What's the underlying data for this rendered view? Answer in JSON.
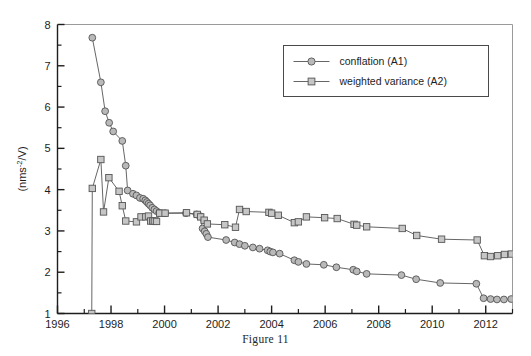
{
  "figure": {
    "caption": "Figure 11"
  },
  "chart_data": {
    "type": "line",
    "title": "",
    "xlabel": "",
    "ylabel": "(nms-2/V)",
    "ylabel_parts": {
      "pre": "(nms",
      "sup": "-2",
      "post": "/V)"
    },
    "xlim": [
      1996,
      2013
    ],
    "ylim": [
      1,
      8
    ],
    "xticks": [
      1996,
      1998,
      2000,
      2002,
      2004,
      2006,
      2008,
      2010,
      2012
    ],
    "xtick_labels": [
      "1996",
      "1998",
      "2000",
      "2002",
      "2004",
      "2006",
      "2008",
      "2010",
      "2012"
    ],
    "xminor_ticks": [
      1997,
      1999,
      2001,
      2003,
      2005,
      2007,
      2009,
      2011,
      2013
    ],
    "yticks": [
      1,
      2,
      3,
      4,
      5,
      6,
      7,
      8
    ],
    "ytick_labels": [
      "1",
      "2",
      "3",
      "4",
      "5",
      "6",
      "7",
      "8"
    ],
    "yminor_ticks": [
      1.5,
      2.5,
      3.5,
      4.5,
      5.5,
      6.5,
      7.5
    ],
    "grid": false,
    "legend_position": "upper-right",
    "series": [
      {
        "name": "conflation (A1)",
        "marker": "circle",
        "color": "#555555",
        "marker_fill": "#b9b9b9",
        "x": [
          1997.3,
          1997.62,
          1997.78,
          1997.93,
          1998.08,
          1998.42,
          1998.55,
          1998.62,
          1998.82,
          1998.95,
          1999.08,
          1999.2,
          1999.28,
          1999.34,
          1999.4,
          1999.46,
          1999.54,
          1999.62,
          1999.7,
          1999.8,
          2000.02,
          2000.8,
          2001.2,
          2001.32,
          2001.42,
          2001.5,
          2001.56,
          2001.62,
          2002.3,
          2002.62,
          2002.8,
          2003.0,
          2003.3,
          2003.55,
          2003.85,
          2003.95,
          2004.05,
          2004.3,
          2004.85,
          2005.0,
          2005.3,
          2005.95,
          2006.42,
          2007.05,
          2007.18,
          2007.55,
          2008.85,
          2009.4,
          2010.3,
          2011.65,
          2011.92,
          2012.18,
          2012.42,
          2012.68,
          2012.95
        ],
        "y": [
          7.68,
          6.6,
          5.9,
          5.62,
          5.41,
          5.18,
          4.58,
          3.98,
          3.9,
          3.86,
          3.8,
          3.78,
          3.74,
          3.7,
          3.66,
          3.62,
          3.56,
          3.52,
          3.48,
          3.44,
          3.43,
          3.43,
          3.4,
          3.36,
          3.06,
          2.99,
          2.93,
          2.85,
          2.78,
          2.72,
          2.68,
          2.64,
          2.6,
          2.57,
          2.53,
          2.5,
          2.48,
          2.45,
          2.29,
          2.25,
          2.2,
          2.18,
          2.12,
          2.06,
          2.02,
          1.96,
          1.93,
          1.83,
          1.74,
          1.72,
          1.37,
          1.35,
          1.34,
          1.34,
          1.35
        ]
      },
      {
        "name": "weighted variance (A2)",
        "marker": "square",
        "color": "#555555",
        "marker_fill": "#c6c6c6",
        "x": [
          1997.28,
          1997.3,
          1997.62,
          1997.72,
          1997.92,
          1998.3,
          1998.42,
          1998.55,
          1998.95,
          1999.12,
          1999.3,
          1999.4,
          1999.48,
          1999.56,
          1999.62,
          1999.7,
          1999.82,
          2000.02,
          2000.82,
          2001.22,
          2001.35,
          2001.48,
          2001.6,
          2002.25,
          2002.65,
          2002.8,
          2003.05,
          2003.9,
          2004.0,
          2004.25,
          2004.85,
          2005.0,
          2005.3,
          2005.98,
          2006.45,
          2007.08,
          2007.18,
          2007.55,
          2008.88,
          2009.42,
          2010.35,
          2011.68,
          2011.95,
          2012.18,
          2012.45,
          2012.7,
          2012.96
        ],
        "y": [
          1.0,
          4.03,
          4.73,
          3.46,
          4.29,
          3.96,
          3.61,
          3.24,
          3.22,
          3.34,
          3.34,
          3.36,
          3.24,
          3.24,
          3.24,
          3.23,
          3.43,
          3.43,
          3.44,
          3.4,
          3.34,
          3.26,
          3.17,
          3.15,
          3.09,
          3.52,
          3.47,
          3.45,
          3.43,
          3.38,
          3.2,
          3.22,
          3.34,
          3.32,
          3.3,
          3.16,
          3.14,
          3.1,
          3.06,
          2.89,
          2.8,
          2.78,
          2.4,
          2.38,
          2.4,
          2.43,
          2.44
        ]
      }
    ]
  },
  "legend": {
    "entries": [
      {
        "label": "conflation (A1)",
        "marker": "circle"
      },
      {
        "label": "weighted variance (A2)",
        "marker": "square"
      }
    ]
  }
}
